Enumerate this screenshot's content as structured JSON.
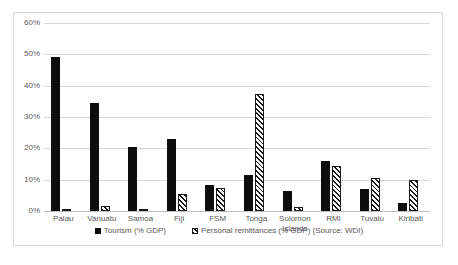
{
  "chart_data": {
    "type": "bar",
    "title": "",
    "xlabel": "",
    "ylabel": "",
    "ylim": [
      0,
      60
    ],
    "ytick_labels": [
      "0%",
      "10%",
      "20%",
      "30%",
      "40%",
      "50%",
      "60%"
    ],
    "ytick_values": [
      0,
      10,
      20,
      30,
      40,
      50,
      60
    ],
    "grid": true,
    "legend_position": "bottom",
    "categories": [
      "Palau",
      "Vanuatu",
      "Samoa",
      "Fiji",
      "FSM",
      "Tonga",
      "Solomon Islands",
      "RMI",
      "Tuvalu",
      "Kiribati"
    ],
    "series": [
      {
        "name": "Tourism (% GDP)",
        "style": "solid-black",
        "values": [
          49.0,
          34.6,
          20.3,
          23.0,
          8.2,
          11.5,
          6.5,
          16.1,
          6.9,
          2.4
        ]
      },
      {
        "name": "Personal remittances (% GDP) (Source: WDI)",
        "style": "diagonal-hatch",
        "values": [
          0.6,
          1.7,
          0.4,
          5.3,
          7.4,
          37.2,
          1.4,
          14.3,
          10.4,
          10.0
        ]
      }
    ]
  },
  "legend": {
    "items": [
      {
        "label": "Tourism (% GDP)",
        "swatch": "solid-square-icon"
      },
      {
        "label": "Personal remittances (% GDP) (Source: WDI)",
        "swatch": "hatched-square-icon"
      }
    ]
  },
  "colors": {
    "series_tourism": "#0d0d0d",
    "series_remittances": "#1a1a1a",
    "gridline": "#d9d9d9",
    "axis": "#bfbfbf",
    "text": "#595959",
    "border": "#d9d9d9",
    "background": "#ffffff"
  }
}
